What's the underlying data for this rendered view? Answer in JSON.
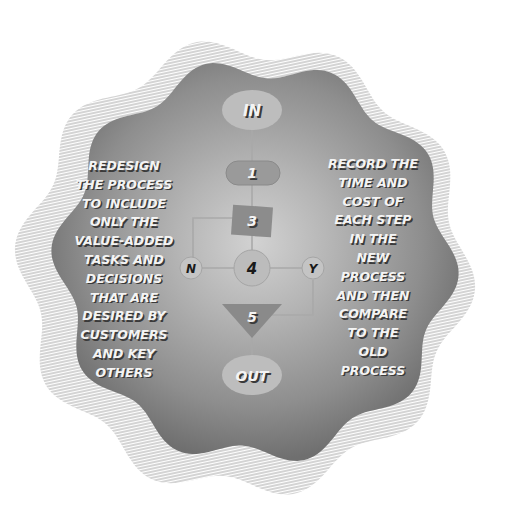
{
  "diagram": {
    "colors": {
      "blob_center": "#cfcfcf",
      "blob_edge": "#747474",
      "hatch": "#9a9a9a",
      "node_light": "#b9b9b9",
      "node_dark": "#8c8c8c",
      "connector": "#a8a8a8",
      "text_light": "#f4f4f4",
      "text_dark": "#1a1a1a"
    },
    "nodes": [
      {
        "id": "in",
        "shape": "ellipse",
        "label": "IN"
      },
      {
        "id": "1",
        "shape": "rounded-rect",
        "label": "1"
      },
      {
        "id": "3",
        "shape": "rect",
        "label": "3"
      },
      {
        "id": "4",
        "shape": "circle",
        "label": "4"
      },
      {
        "id": "n",
        "shape": "small-circle",
        "label": "N"
      },
      {
        "id": "y",
        "shape": "small-circle",
        "label": "Y"
      },
      {
        "id": "5",
        "shape": "inverted-triangle",
        "label": "5"
      },
      {
        "id": "out",
        "shape": "ellipse",
        "label": "OUT"
      }
    ],
    "edges": [
      {
        "from": "IN",
        "to": "1"
      },
      {
        "from": "1",
        "to": "3"
      },
      {
        "from": "3",
        "to": "4"
      },
      {
        "from": "3",
        "to": "N"
      },
      {
        "from": "N",
        "to": "4"
      },
      {
        "from": "4",
        "to": "Y"
      },
      {
        "from": "Y",
        "to": "5"
      },
      {
        "from": "5",
        "to": "OUT"
      }
    ],
    "left_text": {
      "lines": [
        "REDESIGN",
        "THE PROCESS",
        "TO INCLUDE",
        "ONLY THE",
        "VALUE-ADDED",
        "TASKS AND",
        "DECISIONS",
        "THAT ARE",
        "DESIRED BY",
        "CUSTOMERS",
        "AND KEY",
        "OTHERS"
      ]
    },
    "right_text": {
      "lines": [
        "RECORD THE",
        "TIME AND",
        "COST OF",
        "EACH STEP",
        "IN THE",
        "NEW",
        "PROCESS",
        "AND THEN",
        "COMPARE",
        "TO THE",
        "OLD",
        "PROCESS"
      ]
    }
  }
}
